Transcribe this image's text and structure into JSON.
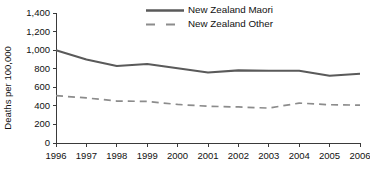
{
  "chart_data": {
    "type": "line",
    "title": "",
    "xlabel": "",
    "ylabel": "Deaths per 100,000",
    "x": [
      1996,
      1997,
      1998,
      1999,
      2000,
      2001,
      2002,
      2003,
      2004,
      2005,
      2006
    ],
    "xtick_labels": [
      "1996",
      "1997",
      "1998",
      "1999",
      "2000",
      "2001",
      "2002",
      "2003",
      "2004",
      "2005",
      "2006"
    ],
    "ytick_labels": [
      "0",
      "200",
      "400",
      "600",
      "800",
      "1,000",
      "1,200",
      "1,400"
    ],
    "yticks": [
      0,
      200,
      400,
      600,
      800,
      1000,
      1200,
      1400
    ],
    "ylim": [
      0,
      1400
    ],
    "xlim": [
      1996,
      2006
    ],
    "grid": false,
    "legend_position": "top-center",
    "series": [
      {
        "name": "New Zealand Maori",
        "style": "solid",
        "color": "#5a5a5a",
        "values": [
          1000,
          900,
          830,
          850,
          805,
          760,
          782,
          778,
          778,
          725,
          745
        ]
      },
      {
        "name": "New Zealand Other",
        "style": "dashed",
        "color": "#8c8c8c",
        "values": [
          510,
          485,
          452,
          448,
          415,
          396,
          388,
          376,
          430,
          412,
          408
        ]
      }
    ]
  },
  "legend": {
    "items": [
      {
        "label": "New Zealand Maori"
      },
      {
        "label": "New Zealand Other"
      }
    ]
  },
  "colors": {
    "maori_line": "#5a5a5a",
    "other_line": "#8c8c8c",
    "axis": "#3a3a3a",
    "text": "#111111",
    "background": "#ffffff"
  }
}
